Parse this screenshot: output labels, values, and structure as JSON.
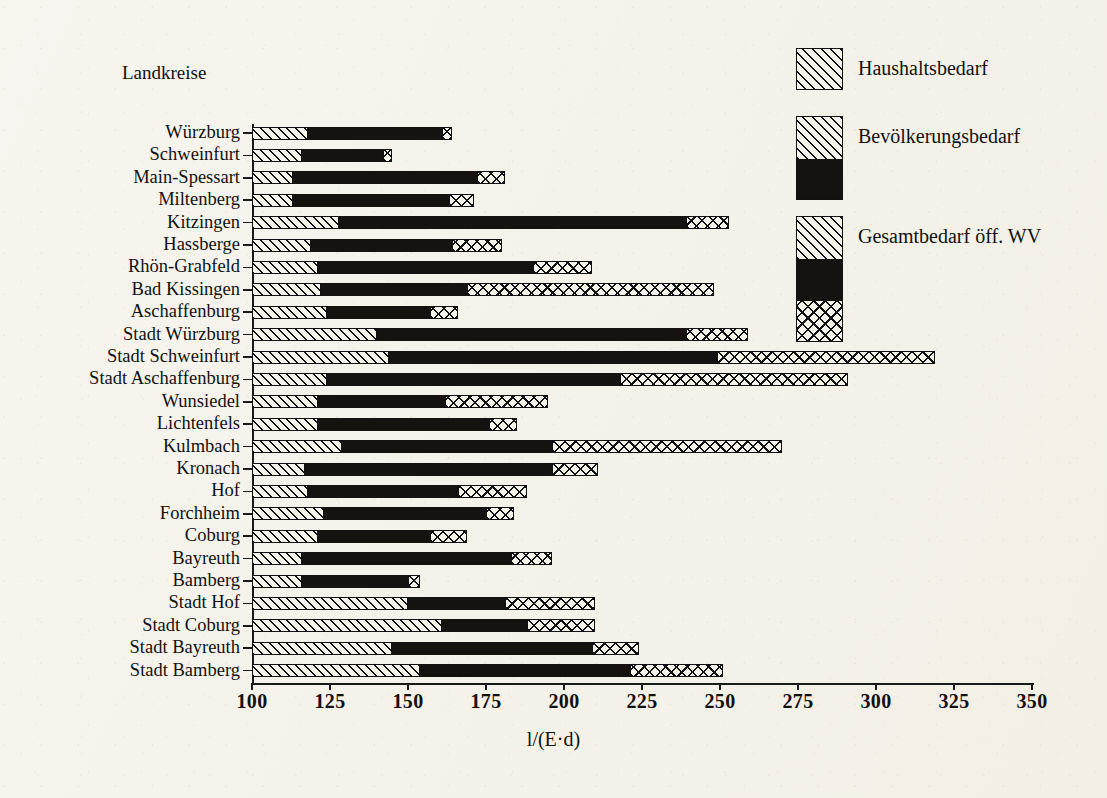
{
  "group_title": "Landkreise",
  "axis": {
    "title": "l/(E·d)",
    "ticks": [
      100,
      125,
      150,
      175,
      200,
      225,
      250,
      275,
      300,
      325,
      350
    ],
    "min": 100,
    "max": 350
  },
  "legend": {
    "items": [
      {
        "label": "Haushaltsbedarf",
        "segments": [
          "haushalt"
        ]
      },
      {
        "label": "Bevölkerungsbedarf",
        "segments": [
          "haushalt",
          "bevoelkerung"
        ]
      },
      {
        "label": "Gesamtbedarf öff. WV",
        "segments": [
          "haushalt",
          "bevoelkerung",
          "gesamt"
        ]
      }
    ]
  },
  "colors": {
    "paper": "#f4f1e8",
    "ink": "#111111",
    "fill_dark": "#151210",
    "fill_light": "#f6f3ea"
  },
  "chart_data": {
    "type": "bar",
    "orientation": "horizontal",
    "title": "",
    "subtitle": "",
    "xlabel": "l/(E·d)",
    "ylabel": "Landkreise",
    "xlim": [
      100,
      350
    ],
    "grid": false,
    "legend_position": "top-right",
    "stacked": true,
    "note": "Cumulative breakpoints per bar: haushalt = Haushaltsbedarf end, bevoelkerung = Bevölkerungsbedarf end, gesamt = Gesamtbedarf öff. WV end (total bar length). All values in l/(E·d).",
    "categories": [
      "Würzburg",
      "Schweinfurt",
      "Main-Spessart",
      "Miltenberg",
      "Kitzingen",
      "Hassberge",
      "Rhön-Grabfeld",
      "Bad Kissingen",
      "Aschaffenburg",
      "Stadt Würzburg",
      "Stadt Schweinfurt",
      "Stadt Aschaffenburg",
      "Wunsiedel",
      "Lichtenfels",
      "Kulmbach",
      "Kronach",
      "Hof",
      "Forchheim",
      "Coburg",
      "Bayreuth",
      "Bamberg",
      "Stadt Hof",
      "Stadt Coburg",
      "Stadt Bayreuth",
      "Stadt Bamberg"
    ],
    "series": [
      {
        "name": "Haushaltsbedarf",
        "key": "haushalt",
        "values": [
          118,
          116,
          113,
          113,
          128,
          119,
          121,
          122,
          124,
          140,
          144,
          124,
          121,
          121,
          129,
          117,
          118,
          123,
          121,
          116,
          116,
          150,
          161,
          145,
          154
        ]
      },
      {
        "name": "Bevölkerungsbedarf",
        "key": "bevoelkerung",
        "values": [
          161,
          142,
          172,
          163,
          239,
          164,
          190,
          169,
          157,
          239,
          249,
          218,
          162,
          176,
          196,
          196,
          166,
          175,
          157,
          183,
          150,
          181,
          188,
          209,
          221
        ]
      },
      {
        "name": "Gesamtbedarf öff. WV",
        "key": "gesamt",
        "values": [
          164,
          145,
          181,
          171,
          253,
          180,
          209,
          248,
          166,
          259,
          319,
          291,
          195,
          185,
          270,
          211,
          188,
          184,
          169,
          196,
          154,
          210,
          210,
          224,
          251
        ]
      }
    ]
  }
}
